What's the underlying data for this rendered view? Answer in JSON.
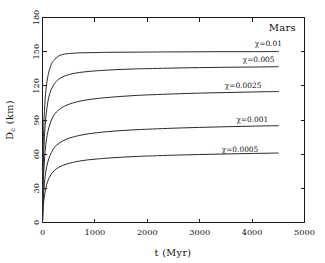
{
  "figure": {
    "annotation": "Mars",
    "background_color": "#ffffff",
    "line_color": "#2a2a2a",
    "axis_color": "#1a1a1a"
  },
  "chart_data": {
    "type": "line",
    "title": "",
    "subtitle": "",
    "annotation": "Mars",
    "xlabel": "t (Myr)",
    "ylabel": "D_c (km)",
    "ylabel_base": "D",
    "ylabel_sub": "c",
    "ylabel_unit": "(km)",
    "xlim": [
      0,
      5000
    ],
    "ylim": [
      0,
      180
    ],
    "xticks": [
      0,
      1000,
      2000,
      3000,
      4000,
      5000
    ],
    "xtick_labels": [
      "0",
      "1000",
      "2000",
      "3000",
      "4000",
      "5000"
    ],
    "yticks": [
      0,
      30,
      60,
      90,
      120,
      150,
      180
    ],
    "ytick_labels": [
      "0",
      "30",
      "60",
      "90",
      "120",
      "150",
      "180"
    ],
    "grid": false,
    "legend": "inline-labels",
    "legend_position": "right-of-curves",
    "series": [
      {
        "name": "chi=0.01",
        "label": "χ=0.01",
        "label_x": 4050,
        "label_y": 155,
        "x": [
          0,
          10,
          25,
          50,
          80,
          120,
          170,
          230,
          300,
          380,
          470,
          570,
          700,
          850,
          1000,
          1200,
          1500,
          1800,
          2100,
          2500,
          3000,
          3500,
          4000,
          4500
        ],
        "values": [
          0,
          55,
          85,
          108,
          122,
          132,
          139,
          143,
          146,
          147.5,
          148.2,
          148.6,
          148.9,
          149.1,
          149.2,
          149.4,
          149.5,
          149.6,
          149.7,
          149.8,
          149.9,
          150.0,
          150.0,
          150.1
        ]
      },
      {
        "name": "chi=0.005",
        "label": "χ=0.005",
        "label_x": 3820,
        "label_y": 141,
        "x": [
          0,
          10,
          25,
          50,
          80,
          120,
          170,
          230,
          300,
          380,
          470,
          570,
          700,
          850,
          1000,
          1200,
          1500,
          1800,
          2100,
          2500,
          3000,
          3500,
          4000,
          4500
        ],
        "values": [
          0,
          40,
          63,
          85,
          99,
          110,
          117,
          122,
          125.5,
          127.8,
          129.4,
          130.6,
          131.7,
          132.5,
          133.1,
          133.7,
          134.4,
          134.9,
          135.2,
          135.6,
          136.0,
          136.3,
          136.5,
          136.8
        ]
      },
      {
        "name": "chi=0.0025",
        "label": "χ=0.0025",
        "label_x": 3480,
        "label_y": 118,
        "x": [
          0,
          10,
          25,
          50,
          80,
          120,
          170,
          230,
          300,
          380,
          470,
          570,
          700,
          850,
          1000,
          1200,
          1500,
          1800,
          2100,
          2500,
          3000,
          3500,
          4000,
          4500
        ],
        "values": [
          0,
          28,
          45,
          62,
          74,
          83,
          90,
          95,
          98.5,
          101.2,
          103.2,
          104.8,
          106.4,
          107.7,
          108.6,
          109.6,
          110.7,
          111.6,
          112.2,
          112.9,
          113.6,
          114.1,
          114.6,
          115.0
        ]
      },
      {
        "name": "chi=0.001",
        "label": "χ=0.001",
        "label_x": 3700,
        "label_y": 88,
        "x": [
          0,
          10,
          25,
          50,
          80,
          120,
          170,
          230,
          300,
          380,
          470,
          570,
          700,
          850,
          1000,
          1200,
          1500,
          1800,
          2100,
          2500,
          3000,
          3500,
          4000,
          4500
        ],
        "values": [
          0,
          17,
          28,
          40,
          49,
          56,
          61.5,
          66,
          69,
          71.5,
          73.4,
          74.9,
          76.4,
          77.7,
          78.6,
          79.6,
          80.7,
          81.5,
          82.1,
          82.8,
          83.5,
          84.1,
          84.6,
          85.0
        ]
      },
      {
        "name": "chi=0.0005",
        "label": "χ=0.0005",
        "label_x": 3420,
        "label_y": 62,
        "x": [
          0,
          10,
          25,
          50,
          80,
          120,
          170,
          230,
          300,
          380,
          470,
          570,
          700,
          850,
          1000,
          1200,
          1500,
          1800,
          2100,
          2500,
          3000,
          3500,
          4000,
          4500
        ],
        "values": [
          0,
          11,
          19,
          27,
          33.5,
          38.5,
          42.5,
          45.8,
          48.2,
          50.0,
          51.5,
          52.7,
          53.9,
          54.9,
          55.6,
          56.4,
          57.3,
          58.0,
          58.5,
          59.1,
          59.7,
          60.2,
          60.6,
          61.0
        ]
      }
    ]
  }
}
